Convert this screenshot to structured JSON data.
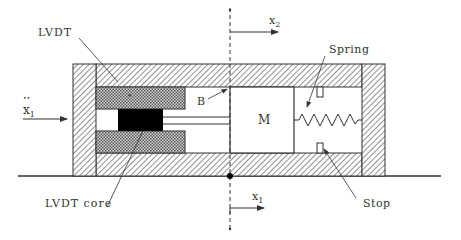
{
  "diagram": {
    "labels": {
      "lvdt": "LVDT",
      "lvdt_core": "LVDT core",
      "spring": "Spring",
      "stop": "Stop",
      "mass": "M",
      "bearing": "B",
      "x2": "x",
      "x2_sub": "2",
      "x1_bottom": "x",
      "x1_bottom_sub": "1",
      "x1_accel": "x",
      "x1_accel_sub": "1",
      "x1_accel_dots": "••"
    },
    "colors": {
      "stroke": "#333333",
      "hatch": "#555555",
      "core": "#000000",
      "background": "#ffffff"
    }
  }
}
